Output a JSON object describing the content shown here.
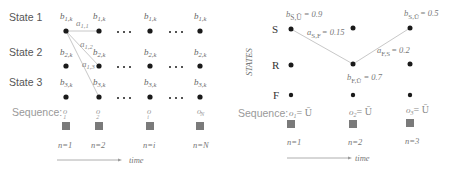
{
  "left_diagram": {
    "states": [
      "State 1",
      "State 2",
      "State 3"
    ],
    "emission_labels": [
      [
        "b",
        "1,k"
      ],
      [
        "b",
        "2,k"
      ],
      [
        "b",
        "3,k"
      ]
    ],
    "transitions": [
      {
        "symbol": "a",
        "sub": "1,1"
      },
      {
        "symbol": "a",
        "sub": "1,2"
      },
      {
        "symbol": "a",
        "sub": "1,3"
      }
    ],
    "ellipsis": "• • •",
    "sequence_label": "Sequence:",
    "observations": [
      {
        "symbol": "o",
        "sub": "1"
      },
      {
        "symbol": "o",
        "sub": "2"
      },
      {
        "symbol": "o",
        "sub": "i"
      },
      {
        "symbol": "o",
        "sub": "N"
      }
    ],
    "steps": [
      "n=1",
      "n=2",
      "n=i",
      "n=N"
    ],
    "time_label": "time"
  },
  "right_diagram": {
    "axis_label": "STATES",
    "states": [
      "S",
      "R",
      "F"
    ],
    "annotations": [
      {
        "symbol": "b",
        "sub": "S,Ū",
        "value": "= 0.9"
      },
      {
        "symbol": "a",
        "sub": "S,F",
        "value": "= 0.15"
      },
      {
        "symbol": "b",
        "sub": "F,Ū",
        "value": "= 0.7"
      },
      {
        "symbol": "a",
        "sub": "F,S",
        "value": "= 0.2"
      },
      {
        "symbol": "b",
        "sub": "S,Ū",
        "value": "= 0.5"
      }
    ],
    "sequence_label": "Sequence:",
    "observations": [
      {
        "symbol": "o",
        "sub": "1",
        "value": "= Ū"
      },
      {
        "symbol": "o",
        "sub": "2",
        "value": "= Ū"
      },
      {
        "symbol": "o",
        "sub": "3",
        "value": "= Ū"
      }
    ],
    "steps": [
      "n=1",
      "n=2",
      "n=3"
    ],
    "time_label": "time"
  },
  "colors": {
    "dot": "#1a1a1a",
    "line": "#c8c8c8",
    "label": "#555555",
    "light_label": "#8a8a8a",
    "square": "#7a7a7a"
  }
}
